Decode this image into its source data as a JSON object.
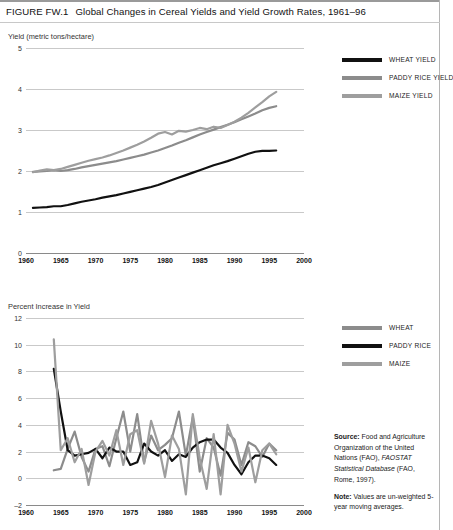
{
  "figure": {
    "label": "FIGURE FW.1",
    "title": "Global Changes in Cereal Yields and Yield Growth Rates, 1961–96"
  },
  "notes": {
    "source_label": "Source:",
    "source_text_1": " Food and Agriculture Organization of the United Nations (FAO), ",
    "source_italic": "FAOSTAT Statistical Database",
    "source_text_2": " (FAO, Rome, 1997).",
    "note_label": "Note:",
    "note_text": " Values are un-weighted 5-year moving averages."
  },
  "colors": {
    "wheat_top": "#111111",
    "rice_top": "#8c8c8c",
    "maize_top": "#9e9e9e",
    "wheat_bottom": "#8c8c8c",
    "rice_bottom": "#111111",
    "maize_bottom": "#9e9e9e",
    "gridline": "#c9c9c9",
    "axis": "#8a8a8a"
  },
  "chart_data": [
    {
      "id": "yields",
      "type": "line",
      "title": "Global Changes in Cereal Yields, 1961–96",
      "xlabel": "",
      "ylabel": "Yield (metric tons/hectare)",
      "xlim": [
        1960,
        2000
      ],
      "ylim": [
        0,
        5
      ],
      "xticks": [
        1960,
        1965,
        1970,
        1975,
        1980,
        1985,
        1990,
        1995,
        2000
      ],
      "yticks": [
        0,
        1,
        2,
        3,
        4,
        5
      ],
      "grid": true,
      "legend_position": "right",
      "x": [
        1961,
        1962,
        1963,
        1964,
        1965,
        1966,
        1967,
        1968,
        1969,
        1970,
        1971,
        1972,
        1973,
        1974,
        1975,
        1976,
        1977,
        1978,
        1979,
        1980,
        1981,
        1982,
        1983,
        1984,
        1985,
        1986,
        1987,
        1988,
        1989,
        1990,
        1991,
        1992,
        1993,
        1994,
        1995,
        1996
      ],
      "series": [
        {
          "name": "WHEAT YIELD",
          "color": "#111111",
          "values": [
            1.1,
            1.11,
            1.12,
            1.14,
            1.14,
            1.17,
            1.21,
            1.25,
            1.28,
            1.31,
            1.35,
            1.38,
            1.41,
            1.45,
            1.49,
            1.53,
            1.57,
            1.61,
            1.66,
            1.72,
            1.78,
            1.84,
            1.9,
            1.96,
            2.02,
            2.08,
            2.14,
            2.19,
            2.24,
            2.3,
            2.36,
            2.42,
            2.47,
            2.49,
            2.49,
            2.5
          ]
        },
        {
          "name": "PADDY RICE YIELD",
          "color": "#8c8c8c",
          "values": [
            1.98,
            1.99,
            2.0,
            2.02,
            2.0,
            2.02,
            2.05,
            2.09,
            2.12,
            2.15,
            2.18,
            2.21,
            2.24,
            2.28,
            2.32,
            2.36,
            2.4,
            2.45,
            2.5,
            2.56,
            2.62,
            2.69,
            2.75,
            2.82,
            2.89,
            2.95,
            3.01,
            3.07,
            3.13,
            3.19,
            3.26,
            3.33,
            3.4,
            3.48,
            3.54,
            3.58
          ]
        },
        {
          "name": "MAIZE YIELD",
          "color": "#9e9e9e",
          "values": [
            1.97,
            2.01,
            2.04,
            2.02,
            2.05,
            2.1,
            2.15,
            2.2,
            2.25,
            2.29,
            2.33,
            2.38,
            2.44,
            2.5,
            2.57,
            2.64,
            2.72,
            2.81,
            2.91,
            2.95,
            2.89,
            2.98,
            2.96,
            3.0,
            3.05,
            3.02,
            3.08,
            3.05,
            3.12,
            3.2,
            3.3,
            3.42,
            3.55,
            3.68,
            3.82,
            3.93
          ]
        }
      ]
    },
    {
      "id": "growth-rates",
      "type": "line",
      "title": "Cereal Yield Growth Rates, 1961–96",
      "xlabel": "",
      "ylabel": "Percent Increase in Yield",
      "xlim": [
        1960,
        2000
      ],
      "ylim": [
        -2,
        12
      ],
      "xticks": [
        1960,
        1965,
        1970,
        1975,
        1980,
        1985,
        1990,
        1995,
        2000
      ],
      "yticks": [
        -2,
        0,
        2,
        4,
        6,
        8,
        10,
        12
      ],
      "grid": true,
      "legend_position": "right",
      "x": [
        1964,
        1965,
        1966,
        1967,
        1968,
        1969,
        1970,
        1971,
        1972,
        1973,
        1974,
        1975,
        1976,
        1977,
        1978,
        1979,
        1980,
        1981,
        1982,
        1983,
        1984,
        1985,
        1986,
        1987,
        1988,
        1989,
        1990,
        1991,
        1992,
        1993,
        1994,
        1995,
        1996
      ],
      "series": [
        {
          "name": "WHEAT",
          "color": "#8c8c8c",
          "values": [
            0.6,
            0.7,
            2.2,
            3.5,
            1.6,
            0.5,
            2.2,
            2.4,
            0.9,
            3.0,
            5.0,
            2.0,
            4.8,
            1.2,
            3.2,
            2.1,
            2.5,
            3.0,
            5.0,
            1.7,
            4.6,
            0.5,
            3.0,
            2.3,
            0.2,
            3.4,
            2.9,
            1.0,
            2.7,
            2.4,
            1.6,
            2.6,
            2.1
          ]
        },
        {
          "name": "PADDY RICE",
          "color": "#111111",
          "values": [
            8.2,
            5.0,
            2.1,
            1.7,
            1.8,
            1.9,
            2.2,
            1.5,
            2.3,
            2.0,
            2.0,
            1.0,
            1.2,
            2.6,
            2.0,
            1.7,
            2.1,
            1.3,
            1.8,
            1.6,
            2.3,
            2.7,
            2.9,
            2.9,
            2.3,
            1.9,
            1.0,
            0.3,
            1.2,
            1.7,
            1.7,
            1.5,
            1.0
          ]
        },
        {
          "name": "MAIZE",
          "color": "#9e9e9e",
          "values": [
            10.4,
            2.1,
            3.0,
            1.2,
            2.2,
            -0.5,
            2.0,
            2.8,
            1.7,
            3.6,
            1.0,
            3.3,
            3.6,
            1.1,
            4.3,
            2.6,
            0.1,
            3.2,
            2.2,
            -1.2,
            4.8,
            1.5,
            -0.8,
            3.3,
            -1.2,
            4.0,
            2.6,
            0.5,
            2.3,
            -0.3,
            2.1,
            2.6,
            1.8
          ]
        }
      ]
    }
  ]
}
